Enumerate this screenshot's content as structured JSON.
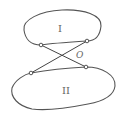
{
  "diagram": {
    "bodies": [
      {
        "id": "body-1",
        "label": "I"
      },
      {
        "id": "body-2",
        "label": "II"
      }
    ],
    "crossing_point_label": "O",
    "links": [
      {
        "id": "link-a",
        "from": "body-1 left pin",
        "to": "body-2 right pin"
      },
      {
        "id": "link-b",
        "from": "body-1 right pin",
        "to": "body-2 left pin"
      }
    ],
    "colors": {
      "stroke": "#555555",
      "background": "#ffffff",
      "label": "#666666"
    }
  }
}
